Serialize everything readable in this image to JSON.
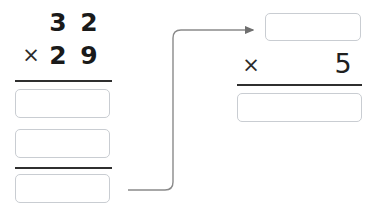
{
  "worksheet": {
    "type": "multiplication-worksheet",
    "width": 382,
    "height": 223,
    "background_color": "#ffffff",
    "box_border_color": "#c9cdd2",
    "rule_color": "#2f2f2f",
    "digit_color": "#1a1a1a",
    "arrow_color": "#7a7a7a"
  },
  "left_problem": {
    "multiplicand": {
      "tens": "3",
      "ones": "2",
      "value": "32"
    },
    "multiplier": {
      "operator": "×",
      "tens": "2",
      "ones": "9",
      "value": "29"
    },
    "partial_product_box_1": {
      "value": "",
      "placeholder": ""
    },
    "partial_product_box_2": {
      "value": "",
      "placeholder": ""
    },
    "total_box": {
      "value": "",
      "placeholder": ""
    }
  },
  "right_problem": {
    "carried_value_box": {
      "value": "",
      "placeholder": ""
    },
    "multiplier": {
      "operator": "×",
      "digit": "5"
    },
    "answer_box": {
      "value": "",
      "placeholder": ""
    }
  },
  "connector": {
    "name": "result-carry-arrow",
    "from": "left total box",
    "to": "right carried value box",
    "direction": "right-then-up"
  }
}
